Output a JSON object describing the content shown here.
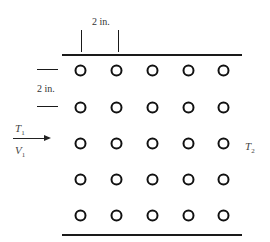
{
  "diagram": {
    "spacing": {
      "transverse_label": "2 in.",
      "longitudinal_label": "2 in."
    },
    "inlet": {
      "temperature_label": "T",
      "temperature_sub": "1",
      "velocity_label": "V",
      "velocity_sub": "1"
    },
    "outlet": {
      "temperature_label": "T",
      "temperature_sub": "2"
    },
    "tube_grid": {
      "rows": 5,
      "columns": 5,
      "arrangement": "in-line",
      "color": "#111111"
    }
  }
}
